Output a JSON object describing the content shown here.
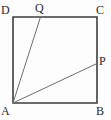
{
  "figure": {
    "canvas": {
      "width": 111,
      "height": 120,
      "background": "#fdfdfd"
    },
    "style": {
      "square_stroke": "#3d3d3d",
      "square_stroke_width": 1.6,
      "segment_stroke": "#6e6e6e",
      "segment_stroke_width": 1.0,
      "label_color": "#2b2b2b",
      "label_font_size": 12
    },
    "points": [
      {
        "id": "A",
        "label": "A",
        "x": 13,
        "y": 103,
        "label_x": 1,
        "label_y": 105,
        "role": "square-vertex"
      },
      {
        "id": "B",
        "label": "B",
        "x": 97,
        "y": 103,
        "label_x": 96,
        "label_y": 105,
        "role": "square-vertex"
      },
      {
        "id": "C",
        "label": "C",
        "x": 97,
        "y": 17,
        "label_x": 96,
        "label_y": 4,
        "role": "square-vertex"
      },
      {
        "id": "D",
        "label": "D",
        "x": 13,
        "y": 17,
        "label_x": 1,
        "label_y": 4,
        "role": "square-vertex"
      },
      {
        "id": "Q",
        "label": "Q",
        "x": 40.5,
        "y": 17,
        "label_x": 35,
        "label_y": 2,
        "role": "point-on-side-DC"
      },
      {
        "id": "P",
        "label": "P",
        "x": 97,
        "y": 63.5,
        "label_x": 99,
        "label_y": 55,
        "role": "point-on-side-CB"
      }
    ],
    "square": {
      "name": "ABCD",
      "path": "A,B,C,D"
    },
    "segments": [
      {
        "id": "AQ",
        "from": "A",
        "to": "Q"
      },
      {
        "id": "AP",
        "from": "A",
        "to": "P"
      }
    ]
  }
}
